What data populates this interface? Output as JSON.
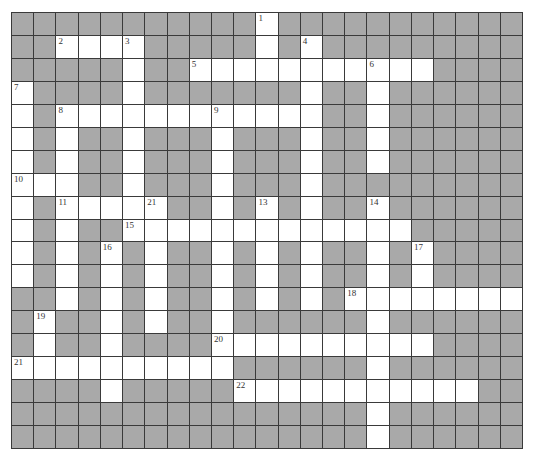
{
  "puzzle": {
    "type": "crossword",
    "cols": 23,
    "rows": 19,
    "colors": {
      "block": "#a9a9a9",
      "open": "#ffffff",
      "line": "#3a3a3a",
      "number": "#333333"
    },
    "open_cells": [
      [
        11
      ],
      [
        2,
        3,
        4,
        5,
        11,
        13
      ],
      [
        5,
        8,
        9,
        10,
        11,
        12,
        13,
        14,
        15,
        16,
        17,
        18
      ],
      [
        0,
        5,
        13,
        16
      ],
      [
        0,
        2,
        3,
        4,
        5,
        6,
        7,
        8,
        9,
        10,
        11,
        12,
        13,
        16
      ],
      [
        0,
        2,
        5,
        9,
        13,
        16
      ],
      [
        0,
        2,
        5,
        9,
        13,
        16
      ],
      [
        0,
        1,
        2,
        5,
        9,
        13
      ],
      [
        0,
        2,
        3,
        4,
        5,
        6,
        9,
        11,
        13,
        16
      ],
      [
        0,
        2,
        5,
        6,
        7,
        8,
        9,
        10,
        11,
        12,
        13,
        14,
        15,
        16,
        17
      ],
      [
        0,
        2,
        4,
        6,
        9,
        11,
        13,
        16,
        18
      ],
      [
        0,
        2,
        4,
        6,
        9,
        11,
        13,
        16,
        18
      ],
      [
        2,
        4,
        6,
        9,
        11,
        13,
        15,
        16,
        17,
        18,
        19,
        20,
        21,
        22
      ],
      [
        1,
        4,
        6,
        9,
        16
      ],
      [
        1,
        4,
        9,
        10,
        11,
        12,
        13,
        14,
        15,
        16,
        17,
        18
      ],
      [
        0,
        1,
        2,
        3,
        4,
        5,
        6,
        7,
        8,
        9,
        16
      ],
      [
        4,
        10,
        11,
        12,
        13,
        14,
        15,
        16,
        17,
        18,
        19,
        20
      ],
      [
        16
      ],
      [
        16
      ]
    ],
    "clue_numbers": [
      {
        "label": "1",
        "row": 0,
        "col": 11
      },
      {
        "label": "2",
        "row": 1,
        "col": 2
      },
      {
        "label": "3",
        "row": 1,
        "col": 5
      },
      {
        "label": "4",
        "row": 1,
        "col": 13
      },
      {
        "label": "5",
        "row": 2,
        "col": 8
      },
      {
        "label": "6",
        "row": 2,
        "col": 16
      },
      {
        "label": "7",
        "row": 3,
        "col": 0
      },
      {
        "label": "8",
        "row": 4,
        "col": 2
      },
      {
        "label": "9",
        "row": 4,
        "col": 9
      },
      {
        "label": "10",
        "row": 7,
        "col": 0
      },
      {
        "label": "11",
        "row": 8,
        "col": 2
      },
      {
        "label": "21",
        "row": 8,
        "col": 6
      },
      {
        "label": "13",
        "row": 8,
        "col": 11
      },
      {
        "label": "14",
        "row": 8,
        "col": 16
      },
      {
        "label": "15",
        "row": 9,
        "col": 5
      },
      {
        "label": "16",
        "row": 10,
        "col": 4
      },
      {
        "label": "17",
        "row": 10,
        "col": 18
      },
      {
        "label": "18",
        "row": 12,
        "col": 15
      },
      {
        "label": "19",
        "row": 13,
        "col": 1
      },
      {
        "label": "20",
        "row": 14,
        "col": 9
      },
      {
        "label": "21",
        "row": 15,
        "col": 0
      },
      {
        "label": "22",
        "row": 16,
        "col": 10
      }
    ]
  }
}
